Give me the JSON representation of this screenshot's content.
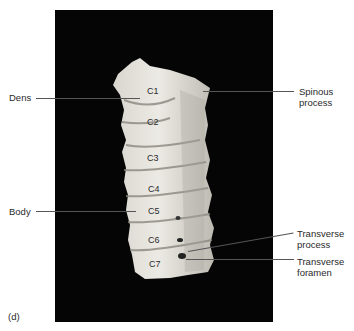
{
  "figure": {
    "panel_label": "(d)",
    "vertebrae": [
      "C1",
      "C2",
      "C3",
      "C4",
      "C5",
      "C6",
      "C7"
    ],
    "labels_left": [
      {
        "text": "Dens"
      },
      {
        "text": "Body"
      }
    ],
    "labels_right": [
      {
        "text": "Spinous\nprocess"
      },
      {
        "text": "Transverse\nprocess"
      },
      {
        "text": "Transverse\nforamen"
      }
    ],
    "colors": {
      "background": "#050505",
      "bone": "#e4e2dc",
      "bone_shadow": "#b9b6ae",
      "leader": "#555555"
    }
  }
}
